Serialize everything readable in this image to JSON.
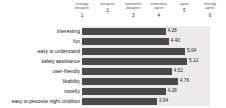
{
  "chart_data": {
    "type": "bar",
    "orientation": "horizontal",
    "title": "",
    "xlabel": "",
    "ylabel": "",
    "xlim": [
      1,
      6
    ],
    "grid": false,
    "legend": null,
    "bar_color": "#4a4a4a",
    "plot_background": "#eceaea",
    "scale": [
      {
        "num": "1",
        "label": "strongly disagree"
      },
      {
        "num": "2",
        "label": "disagree"
      },
      {
        "num": "3",
        "label": "somewhat disagree"
      },
      {
        "num": "4",
        "label": "somewhat agree"
      },
      {
        "num": "5",
        "label": "agree"
      },
      {
        "num": "6",
        "label": "strongly agree"
      }
    ],
    "categories": [
      "interesting",
      "fun",
      "easy to understand",
      "safety aasistance",
      "user-friendly",
      "likability",
      "novelty",
      "easy to perceive night cindition"
    ],
    "values": [
      4.28,
      4.4,
      5.04,
      5.12,
      4.52,
      4.76,
      4.28,
      3.94
    ],
    "value_labels": [
      "4.28",
      "4.40",
      "5.04",
      "5.12",
      "4.52",
      "4.76",
      "4.28",
      "3.94"
    ]
  }
}
